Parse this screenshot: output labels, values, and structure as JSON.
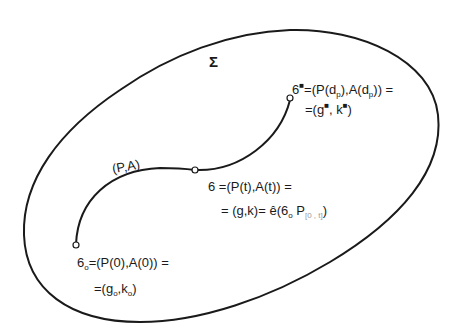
{
  "diagram": {
    "region_label": "Σ",
    "path_label": "(P,A)",
    "stroke_color": "#1a1a1a",
    "background": "#ffffff",
    "points": {
      "end": {
        "symbol": "6",
        "mark": "■",
        "line1_rest": "=(P(d",
        "line1_sub1": "p",
        "line1_mid": "),A(d",
        "line1_sub2": "p",
        "line1_tail": ")) =",
        "line2_head": "=(g",
        "line2_mark1": "■",
        "line2_mid": ", k",
        "line2_mark2": "■",
        "line2_tail": ")"
      },
      "middle": {
        "line1": "6 =(P(t),A(t)) =",
        "line2_head": "= (g,k)= ",
        "line2_hat": "ê",
        "line2_mid": "(6",
        "line2_sub": "o",
        "line2_p": " P",
        "line2_faint": "[0 , t]",
        "line2_tail": ")"
      },
      "start": {
        "symbol": "6",
        "sub": "o",
        "line1_rest": "=(P(0),A(0)) =",
        "line2_head": "=(g",
        "line2_sub1": "o",
        "line2_mid": ",k",
        "line2_sub2": "o",
        "line2_tail": ")"
      }
    }
  }
}
